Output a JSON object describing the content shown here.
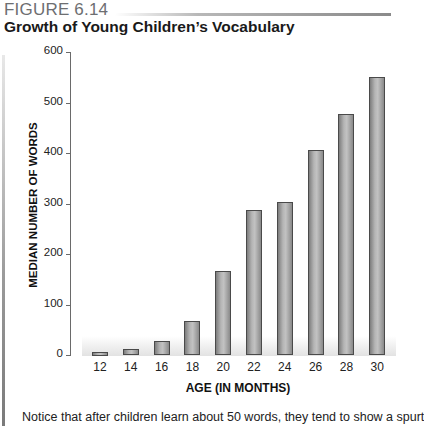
{
  "figure": {
    "label": "FIGURE 6.14",
    "title": "Growth of Young Children’s Vocabulary",
    "caption": "Notice that after children learn about 50 words, they tend to show a spurt"
  },
  "chart_data": {
    "type": "bar",
    "title": "Growth of Young Children’s Vocabulary",
    "xlabel": "AGE (IN MONTHS)",
    "ylabel": "MEDIAN NUMBER OF WORDS",
    "categories": [
      "12",
      "14",
      "16",
      "18",
      "20",
      "22",
      "24",
      "26",
      "28",
      "30"
    ],
    "values": [
      6,
      11,
      28,
      68,
      167,
      287,
      302,
      405,
      477,
      550
    ],
    "ylim": [
      0,
      600
    ],
    "yticks": [
      "0",
      "100",
      "200",
      "300",
      "400",
      "500",
      "600"
    ],
    "grid": false,
    "legend": null,
    "bar_color": "#a8a8a8"
  }
}
